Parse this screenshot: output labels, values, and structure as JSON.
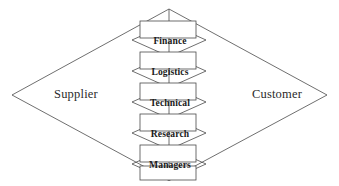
{
  "diagram": {
    "type": "diamond-value-chain",
    "title": "",
    "outer_diamond": {
      "left_label": "Supplier",
      "right_label": "Customer",
      "top_vertex": [
        169,
        9
      ],
      "right_vertex": [
        327,
        95
      ],
      "bottom_vertex": [
        169,
        180
      ],
      "left_vertex": [
        12,
        95
      ]
    },
    "center_stack": {
      "labels": [
        "Finance",
        "Logistics",
        "Technical",
        "Research",
        "Managers"
      ],
      "box_count": 6,
      "box_left": 140,
      "box_right": 196,
      "box_height": 17,
      "chevron_half_width": 37
    },
    "colors": {
      "stroke": "#4a4a4a",
      "fill": "#ffffff",
      "text": "#1a1a1a",
      "side_text": "#2b2b2b",
      "background": "#ffffff"
    }
  }
}
